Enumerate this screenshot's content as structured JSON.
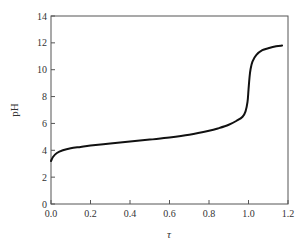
{
  "chart_data": {
    "type": "line",
    "title": "",
    "xlabel": "τ",
    "ylabel": "pH",
    "xlim": [
      0.0,
      1.2
    ],
    "ylim": [
      0,
      14
    ],
    "grid": false,
    "legend": "none",
    "x_ticks": [
      "0.0",
      "0.2",
      "0.4",
      "0.6",
      "0.8",
      "1.0",
      "1.2"
    ],
    "y_ticks": [
      "0",
      "2",
      "4",
      "6",
      "8",
      "10",
      "12",
      "14"
    ],
    "series": [
      {
        "name": "titration curve",
        "color": "#111111",
        "x": [
          0.0,
          0.01,
          0.03,
          0.06,
          0.1,
          0.15,
          0.2,
          0.3,
          0.4,
          0.5,
          0.6,
          0.7,
          0.8,
          0.85,
          0.9,
          0.94,
          0.97,
          0.985,
          0.995,
          1.0,
          1.005,
          1.01,
          1.02,
          1.04,
          1.07,
          1.1,
          1.14,
          1.17
        ],
        "y": [
          3.2,
          3.5,
          3.8,
          4.0,
          4.15,
          4.25,
          4.35,
          4.5,
          4.65,
          4.8,
          4.95,
          5.15,
          5.45,
          5.65,
          5.9,
          6.2,
          6.5,
          6.9,
          7.6,
          8.5,
          9.4,
          10.0,
          10.6,
          11.1,
          11.45,
          11.6,
          11.75,
          11.8
        ]
      }
    ]
  }
}
